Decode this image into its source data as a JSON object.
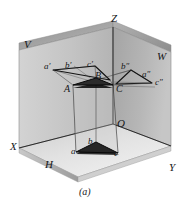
{
  "figure": {
    "caption": "(a)",
    "colors": {
      "v_plane": "#c3c3c3",
      "h_plane": "#dedede",
      "w_plane": "#b0b0b0",
      "top_band": "#9d9d9d",
      "triangle_fill": "#242424",
      "line": "#1b1b1b",
      "thin_line": "#555555",
      "background": "#ffffff"
    },
    "axes": [
      {
        "name": "axis-label-z",
        "text": "Z",
        "x": 111,
        "y": 13
      },
      {
        "name": "axis-label-x",
        "text": "X",
        "x": 10,
        "y": 141
      },
      {
        "name": "axis-label-y",
        "text": "Y",
        "x": 169,
        "y": 162
      },
      {
        "name": "axis-label-o",
        "text": "O",
        "x": 117,
        "y": 118
      }
    ],
    "planes": [
      {
        "name": "plane-label-v",
        "text": "V",
        "x": 24,
        "y": 39
      },
      {
        "name": "plane-label-w",
        "text": "W",
        "x": 157,
        "y": 51
      },
      {
        "name": "plane-label-h",
        "text": "H",
        "x": 45,
        "y": 159
      }
    ],
    "space_triangle": {
      "name": "space-triangle-abc",
      "vertices": [
        {
          "name": "vertex-label-A",
          "text": "A",
          "x": 64,
          "y": 84
        },
        {
          "name": "vertex-label-B",
          "text": "B",
          "x": 95,
          "y": 71
        },
        {
          "name": "vertex-label-C",
          "text": "C",
          "x": 116,
          "y": 84
        }
      ]
    },
    "v_projection": {
      "name": "v-projection-triangle",
      "vertices": [
        {
          "name": "proj-label-a-prime",
          "text": "a′",
          "x": 44,
          "y": 62
        },
        {
          "name": "proj-label-b-prime",
          "text": "b′",
          "x": 65,
          "y": 61
        },
        {
          "name": "proj-label-c-prime",
          "text": "c′",
          "x": 87,
          "y": 60
        }
      ]
    },
    "w_projection": {
      "name": "w-projection-triangle",
      "vertices": [
        {
          "name": "proj-label-b-double-prime",
          "text": "b″",
          "x": 121,
          "y": 62
        },
        {
          "name": "proj-label-a-double-prime",
          "text": "a″",
          "x": 142,
          "y": 70
        },
        {
          "name": "proj-label-c-double-prime",
          "text": "c″",
          "x": 155,
          "y": 78
        }
      ]
    },
    "h_projection": {
      "name": "h-projection-triangle",
      "vertices": [
        {
          "name": "proj-label-a",
          "text": "a",
          "x": 71,
          "y": 147
        },
        {
          "name": "proj-label-b",
          "text": "b",
          "x": 88,
          "y": 137
        },
        {
          "name": "proj-label-c",
          "text": "c",
          "x": 114,
          "y": 149
        }
      ]
    }
  }
}
